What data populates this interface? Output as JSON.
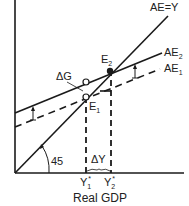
{
  "diagram": {
    "type": "keynesian-cross",
    "colors": {
      "ink": "#1a1a1a",
      "background": "#ffffff"
    },
    "axes": {
      "x_label": "Real GDP",
      "y_label": ""
    },
    "lines": {
      "ae_equals_y": {
        "label": "AE=Y"
      },
      "ae2": {
        "label": "AE",
        "sub": "2"
      },
      "ae1": {
        "label": "AE",
        "sub": "1"
      }
    },
    "points": {
      "e1": {
        "label": "E",
        "sub": "1"
      },
      "e2": {
        "label": "E",
        "sub": "2"
      }
    },
    "annotations": {
      "delta_g": "ΔG",
      "delta_y": "ΔY",
      "angle": "45"
    },
    "x_ticks": {
      "y1": {
        "label": "Y",
        "sub": "1",
        "sup": "*"
      },
      "y2": {
        "label": "Y",
        "sub": "2",
        "sup": "*"
      }
    }
  }
}
